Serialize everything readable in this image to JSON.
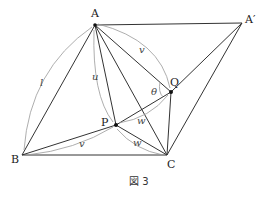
{
  "figure": {
    "caption": "図 3",
    "points": {
      "A": {
        "label": "A",
        "x": 95,
        "y": 25
      },
      "A2": {
        "label": "A′",
        "x": 242,
        "y": 23
      },
      "B": {
        "label": "B",
        "x": 22,
        "y": 155
      },
      "C": {
        "label": "C",
        "x": 167,
        "y": 155
      },
      "P": {
        "label": "P",
        "x": 116,
        "y": 125
      },
      "Q": {
        "label": "Q",
        "x": 171,
        "y": 92
      }
    },
    "segment_labels": {
      "l": "l",
      "u": "u",
      "v_top": "v",
      "v_bottom": "v",
      "w_pq": "w",
      "w_pc": "w",
      "theta": "θ"
    }
  }
}
